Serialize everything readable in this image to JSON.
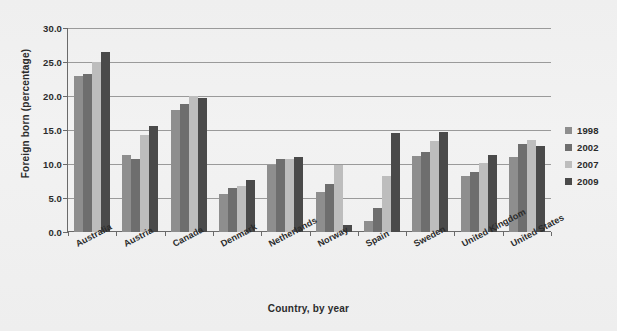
{
  "figure": {
    "clipped_title": "",
    "background_color": "#f0f0f0"
  },
  "axes": {
    "ylabel": "Foreign born (percentage)",
    "xlabel": "Country, by year",
    "yticks": [
      "0.0",
      "5.0",
      "10.0",
      "15.0",
      "20.0",
      "25.0",
      "30.0"
    ]
  },
  "legend": {
    "entries": [
      {
        "label": "1998",
        "color": "#8e8e8e"
      },
      {
        "label": "2002",
        "color": "#6e6e6e"
      },
      {
        "label": "2007",
        "color": "#bdbdbd"
      },
      {
        "label": "2009",
        "color": "#4a4a4a"
      }
    ]
  },
  "chart_data": {
    "type": "bar",
    "title": "",
    "xlabel": "Country, by year",
    "ylabel": "Foreign born (percentage)",
    "ylim": [
      0,
      30
    ],
    "yticks": [
      0,
      5,
      10,
      15,
      20,
      25,
      30
    ],
    "grid": true,
    "legend_position": "right",
    "categories": [
      "Australia",
      "Austria",
      "Canada",
      "Denmark",
      "Netherlands",
      "Norway",
      "Spain",
      "Sweden",
      "United Kingdom",
      "United States"
    ],
    "series": [
      {
        "name": "1998",
        "color": "#8e8e8e",
        "values": [
          23.0,
          11.3,
          17.9,
          5.6,
          9.9,
          5.9,
          1.6,
          11.2,
          8.2,
          11.1
        ]
      },
      {
        "name": "2002",
        "color": "#6e6e6e",
        "values": [
          23.2,
          10.8,
          18.8,
          6.5,
          10.8,
          7.0,
          3.6,
          11.8,
          8.8,
          13.0
        ]
      },
      {
        "name": "2007",
        "color": "#bdbdbd",
        "values": [
          25.0,
          14.2,
          20.0,
          6.7,
          10.8,
          9.9,
          8.3,
          13.4,
          10.2,
          13.6
        ]
      },
      {
        "name": "2009",
        "color": "#4a4a4a",
        "values": [
          26.5,
          15.6,
          19.7,
          7.6,
          11.1,
          1.1,
          14.5,
          14.7,
          11.3,
          12.7
        ]
      }
    ]
  }
}
